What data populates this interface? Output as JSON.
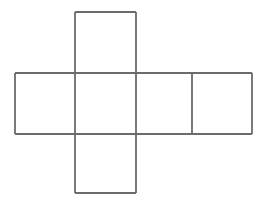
{
  "figure": {
    "description": "Cross-shaped net of a cube made of six squares",
    "shape_type": "cube-net-cross",
    "caption": "",
    "background_color": "#ffffff",
    "stroke_color": "#6b6b6b",
    "stroke_width": 1.8,
    "canvas": {
      "width": 260,
      "height": 202
    },
    "grid": {
      "square_size": 61,
      "x_positions": [
        15,
        75,
        136,
        192,
        252
      ],
      "y_positions": [
        12,
        73,
        134,
        193
      ]
    },
    "faces": [
      {
        "name": "top-face",
        "position": "top",
        "x": 75,
        "y": 12,
        "width": 61,
        "height": 61,
        "label": ""
      },
      {
        "name": "left-face",
        "position": "middle-left",
        "x": 15,
        "y": 73,
        "width": 60,
        "height": 61,
        "label": ""
      },
      {
        "name": "center-face",
        "position": "middle-center",
        "x": 75,
        "y": 73,
        "width": 61,
        "height": 61,
        "label": ""
      },
      {
        "name": "right-face",
        "position": "middle-right",
        "x": 136,
        "y": 73,
        "width": 56,
        "height": 61,
        "label": ""
      },
      {
        "name": "far-right-face",
        "position": "middle-far-right",
        "x": 192,
        "y": 73,
        "width": 60,
        "height": 61,
        "label": ""
      },
      {
        "name": "bottom-face",
        "position": "bottom",
        "x": 75,
        "y": 134,
        "width": 61,
        "height": 59,
        "label": ""
      }
    ],
    "edges": [
      {
        "name": "top-square-top-edge",
        "x1": 75,
        "y1": 12,
        "x2": 136,
        "y2": 12
      },
      {
        "name": "top-square-left-edge",
        "x1": 75,
        "y1": 12,
        "x2": 75,
        "y2": 73
      },
      {
        "name": "top-square-right-edge",
        "x1": 136,
        "y1": 12,
        "x2": 136,
        "y2": 73
      },
      {
        "name": "middle-row-top-edge",
        "x1": 15,
        "y1": 73,
        "x2": 252,
        "y2": 73
      },
      {
        "name": "middle-row-bottom-edge",
        "x1": 15,
        "y1": 134,
        "x2": 252,
        "y2": 134
      },
      {
        "name": "middle-row-left-edge",
        "x1": 15,
        "y1": 73,
        "x2": 15,
        "y2": 134
      },
      {
        "name": "middle-row-right-edge",
        "x1": 252,
        "y1": 73,
        "x2": 252,
        "y2": 134
      },
      {
        "name": "divider-left-center",
        "x1": 75,
        "y1": 73,
        "x2": 75,
        "y2": 134
      },
      {
        "name": "divider-center-right",
        "x1": 136,
        "y1": 73,
        "x2": 136,
        "y2": 134
      },
      {
        "name": "divider-right-farright",
        "x1": 192,
        "y1": 73,
        "x2": 192,
        "y2": 134
      },
      {
        "name": "bottom-square-left-edge",
        "x1": 75,
        "y1": 134,
        "x2": 75,
        "y2": 193
      },
      {
        "name": "bottom-square-right-edge",
        "x1": 136,
        "y1": 134,
        "x2": 136,
        "y2": 193
      },
      {
        "name": "bottom-square-bottom-edge",
        "x1": 75,
        "y1": 193,
        "x2": 136,
        "y2": 193
      }
    ]
  }
}
